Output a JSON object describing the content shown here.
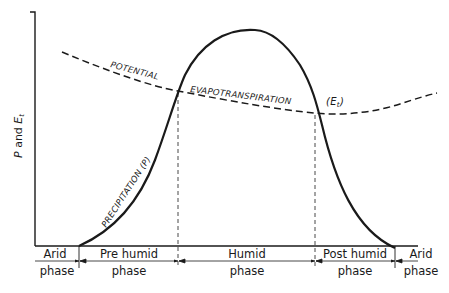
{
  "diagram": {
    "y_axis_label": {
      "p": "P",
      "and": " and ",
      "e": "E",
      "sub": "t"
    },
    "curves": {
      "precipitation": {
        "label": "PRECIPITATION (P)",
        "style": "solid"
      },
      "potential_et": {
        "label_part1": "POTENTIAL",
        "label_part2": "EVAPOTRANSPIRATION",
        "symbol": "(E",
        "symbol_sub": "t",
        "symbol_close": ")",
        "style": "dashed"
      }
    },
    "phases": [
      {
        "line1": "Arid",
        "line2": "phase"
      },
      {
        "line1": "Pre humid",
        "line2": "phase"
      },
      {
        "line1": "Humid",
        "line2": "phase"
      },
      {
        "line1": "Post humid",
        "line2": "phase"
      },
      {
        "line1": "Arid",
        "line2": "phase"
      }
    ],
    "colors": {
      "line": "#1a1a1a",
      "background": "#ffffff"
    }
  }
}
